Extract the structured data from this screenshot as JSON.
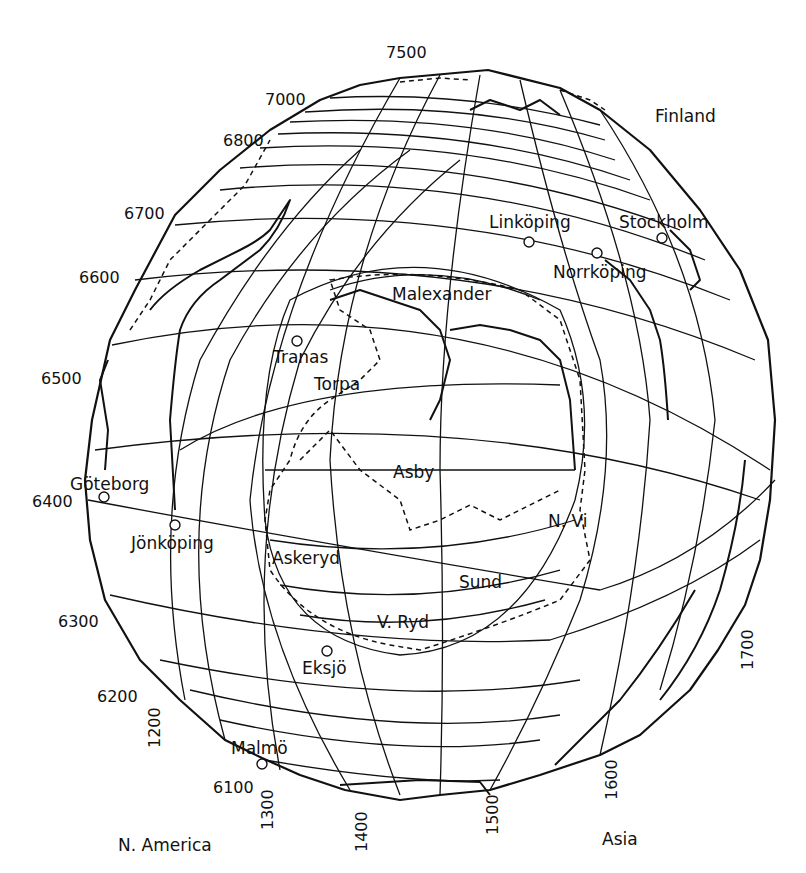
{
  "map": {
    "regions": {
      "finland": "Finland",
      "north_america": "N. America",
      "asia": "Asia"
    },
    "northing_ticks": [
      "7500",
      "7000",
      "6800",
      "6700",
      "6600",
      "6500",
      "6400",
      "6300",
      "6200",
      "6100"
    ],
    "easting_ticks": [
      "1200",
      "1300",
      "1400",
      "1500",
      "1600",
      "1700"
    ],
    "places": [
      {
        "name": "Linköping"
      },
      {
        "name": "Stockholm"
      },
      {
        "name": "Norrköping"
      },
      {
        "name": "Malexander"
      },
      {
        "name": "Tranas"
      },
      {
        "name": "Torpa"
      },
      {
        "name": "Asby"
      },
      {
        "name": "Göteborg"
      },
      {
        "name": "Jönköping"
      },
      {
        "name": "N. Vi"
      },
      {
        "name": "Askeryd"
      },
      {
        "name": "Sund"
      },
      {
        "name": "V. Ryd"
      },
      {
        "name": "Eksjö"
      },
      {
        "name": "Malmö"
      }
    ]
  }
}
